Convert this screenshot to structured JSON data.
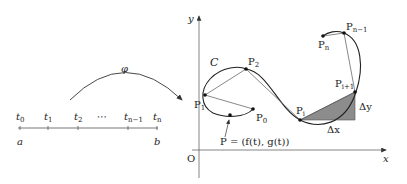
{
  "parameter_axis": {
    "ticks": [
      {
        "label": "t",
        "sub": "0"
      },
      {
        "label": "t",
        "sub": "1"
      },
      {
        "label": "t",
        "sub": "2"
      },
      {
        "label": "⋯",
        "sub": ""
      },
      {
        "label": "t",
        "sub": "n−1"
      },
      {
        "label": "t",
        "sub": "n"
      }
    ],
    "start_label": "a",
    "end_label": "b"
  },
  "mapping": {
    "label": "φ"
  },
  "plane": {
    "x_axis_label": "x",
    "y_axis_label": "y",
    "origin_label": "O",
    "curve_label": "C"
  },
  "points": [
    {
      "id": "P0",
      "label": "P",
      "sub": "0"
    },
    {
      "id": "P1",
      "label": "P",
      "sub": "1"
    },
    {
      "id": "P2",
      "label": "P",
      "sub": "2"
    },
    {
      "id": "Pi",
      "label": "P",
      "sub": "i"
    },
    {
      "id": "Pi1",
      "label": "P",
      "sub": "i+1"
    },
    {
      "id": "Pn1",
      "label": "P",
      "sub": "n−1"
    },
    {
      "id": "Pn",
      "label": "P",
      "sub": "n"
    }
  ],
  "point_P_annotation": "P = (f(t), g(t))",
  "increments": {
    "dx": "Δx",
    "dy": "Δy"
  },
  "colors": {
    "line": "#333333",
    "fill": "#8c8c8c",
    "axis": "#555555"
  }
}
